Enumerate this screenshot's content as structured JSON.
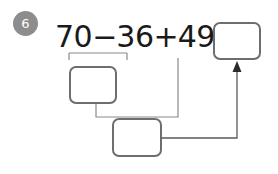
{
  "problem": {
    "number": "6",
    "badge_color": "#8d8d8d",
    "badge_text_color": "#ffffff"
  },
  "equation": {
    "operand1": "70",
    "operator1": "−",
    "operand2": "36",
    "operator2": "+",
    "operand3": "49",
    "equals": "="
  },
  "answer_boxes": [
    {
      "id": "box-sub",
      "name": "partial-difference-box",
      "value": "",
      "placeholder": ""
    },
    {
      "id": "box-sum",
      "name": "partial-sum-box",
      "value": "",
      "placeholder": ""
    },
    {
      "id": "box-result",
      "name": "final-answer-box",
      "value": "",
      "placeholder": ""
    }
  ],
  "annotations": {
    "grouping_bracket_label": "70 − 36",
    "arrow_label": "result-arrow",
    "line_color": "#8a8a8a",
    "box_border_color": "#6e6e6e",
    "text_color": "#1a1a1a",
    "background_color": "#ffffff"
  }
}
